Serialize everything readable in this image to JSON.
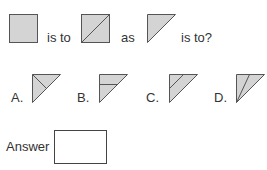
{
  "question": {
    "text_is_to_1": "is to",
    "text_as": "as",
    "text_is_to_q": "is to?",
    "figures": [
      {
        "name": "gray-square",
        "shape": "square"
      },
      {
        "name": "square-with-diagonal",
        "shape": "square-diagonal"
      },
      {
        "name": "right-triangle",
        "shape": "triangle"
      }
    ]
  },
  "options": [
    {
      "label": "A.",
      "variant": "triangle-line-corner-to-hypotenuse"
    },
    {
      "label": "B.",
      "variant": "triangle-horizontal-line"
    },
    {
      "label": "C.",
      "variant": "triangle-parallel-line"
    },
    {
      "label": "D.",
      "variant": "triangle-line-from-bottom-corner"
    }
  ],
  "answer": {
    "label": "Answer",
    "value": ""
  },
  "colors": {
    "fill": "#d4d4d4",
    "stroke": "#555555",
    "text": "#333333"
  }
}
